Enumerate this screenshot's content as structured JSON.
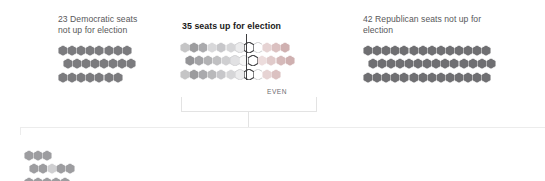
{
  "chart_data": {
    "type": "bar",
    "xlabel": "",
    "ylabel": "",
    "unit": "seats",
    "groups": [
      {
        "id": "dem-not-up",
        "label": "23 Democratic seats\nnot up for election",
        "count": 23,
        "party": "Democratic",
        "up_for_election": false,
        "color": "#7b7b7e",
        "bold": false,
        "rows": [
          8,
          8,
          7
        ]
      },
      {
        "id": "up-for-election",
        "label": "35 seats up for election",
        "count": 35,
        "party": "Mixed",
        "up_for_election": true,
        "bold": true,
        "rows": [
          12,
          12,
          11
        ],
        "gradient_from": "#8d8d90",
        "gradient_to": "#d9b9b9"
      },
      {
        "id": "rep-not-up",
        "label": "42 Republican seats not up for\nelection",
        "count": 42,
        "party": "Republican",
        "up_for_election": false,
        "color": "#6f6f72",
        "bold": false,
        "rows": [
          14,
          14,
          14
        ]
      },
      {
        "id": "detail-cluster",
        "label": "",
        "count": 13,
        "party": "Mixed",
        "up_for_election": true,
        "bold": false,
        "rows": [
          3,
          5,
          5
        ],
        "color": "#9d9da0"
      }
    ],
    "annotations": [
      {
        "id": "even-marker",
        "text": "EVEN",
        "description": "vertical divider marking the even split point within the seats-up-for-election group"
      }
    ],
    "legend": {
      "position": "none",
      "entries": []
    },
    "grid": false
  },
  "labels": {
    "dem_not_up": "23 Democratic seats\nnot up for election",
    "seats_up": "35 seats up for election",
    "rep_not_up": "42 Republican seats not up for\nelection",
    "even": "EVEN"
  },
  "colors": {
    "democratic": "#7b7b7e",
    "republican": "#6f6f72",
    "neutral": "#b9b9bc",
    "white_seat": "#ffffff",
    "outline": "#4a4a4c",
    "bracket": "#e3e3e3",
    "band": "#ececec",
    "text": "#58585a",
    "text_bold": "#1a1a1a"
  }
}
